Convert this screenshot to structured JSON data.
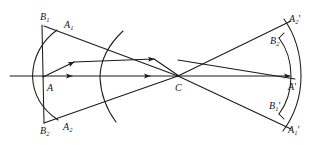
{
  "figure": {
    "stroke_color": "#1a1a1a",
    "background_color": "#ffffff",
    "width": 324,
    "height": 145
  },
  "labels": [
    {
      "id": "B1",
      "base": "B",
      "sub": "1",
      "prime": "",
      "x": 40,
      "y": 12,
      "name": "label-B1"
    },
    {
      "id": "A1",
      "base": "A",
      "sub": "1",
      "prime": "",
      "x": 64,
      "y": 20,
      "name": "label-A1"
    },
    {
      "id": "A",
      "base": "A",
      "sub": "",
      "prime": "",
      "x": 47,
      "y": 83,
      "name": "label-A"
    },
    {
      "id": "B2",
      "base": "B",
      "sub": "2",
      "prime": "",
      "x": 40,
      "y": 126,
      "name": "label-B2"
    },
    {
      "id": "A2",
      "base": "A",
      "sub": "2",
      "prime": "",
      "x": 63,
      "y": 122,
      "name": "label-A2"
    },
    {
      "id": "C",
      "base": "C",
      "sub": "",
      "prime": "",
      "x": 175,
      "y": 83,
      "name": "label-C"
    },
    {
      "id": "A2prime",
      "base": "A",
      "sub": "2",
      "prime": "'",
      "x": 289,
      "y": 14,
      "name": "label-A2-prime"
    },
    {
      "id": "B2prime",
      "base": "B",
      "sub": "2",
      "prime": "",
      "x": 270,
      "y": 36,
      "name": "label-B2-prime"
    },
    {
      "id": "Aprime",
      "base": "A",
      "sub": "",
      "prime": "'",
      "x": 288,
      "y": 82,
      "name": "label-A-prime"
    },
    {
      "id": "B1prime",
      "base": "B",
      "sub": "1",
      "prime": "'",
      "x": 269,
      "y": 101,
      "name": "label-B1-prime"
    },
    {
      "id": "A1prime",
      "base": "A",
      "sub": "1",
      "prime": "'",
      "x": 288,
      "y": 125,
      "name": "label-A1-prime"
    }
  ],
  "geometry": {
    "optical_axis": {
      "x1": 10,
      "y1": 76,
      "x2": 300,
      "y2": 76
    },
    "axis_arrows": [
      {
        "x": 70,
        "y": 76,
        "angle": 0
      },
      {
        "x": 148,
        "y": 76,
        "angle": 0
      }
    ],
    "left_object_line": {
      "x1": 42,
      "y1": 25,
      "x2": 44,
      "y2": 123
    },
    "left_wavefront_arc": "M 57,30 Q 31,76 58,120",
    "middle_wavefront_arc": "M 122,32 Q 100,78 116,121",
    "right_wavefront_arc": "M 286,20 Q 305,76 284,130",
    "right_image_segment": "M 281,40 Q 293,76 280,112",
    "rays": [
      {
        "id": "chief-upper",
        "x1": 44,
        "y1": 26,
        "x2": 178,
        "y2": 76,
        "arrow_at": null
      },
      {
        "id": "chief-lower",
        "x1": 44,
        "y1": 123,
        "x2": 178,
        "y2": 76,
        "arrow_at": null
      },
      {
        "id": "marginal-up",
        "x1": 43,
        "y1": 77,
        "x2": 178,
        "y2": 76,
        "arrow_at": {
          "x": 72,
          "y": 62
        }
      },
      {
        "id": "exit-upper",
        "x1": 178,
        "y1": 76,
        "x2": 290,
        "y2": 22,
        "arrow_at": null
      },
      {
        "id": "exit-lower",
        "x1": 178,
        "y1": 76,
        "x2": 290,
        "y2": 128,
        "arrow_at": null
      },
      {
        "id": "exit-axial",
        "x1": 178,
        "y1": 76,
        "x2": 296,
        "y2": 76,
        "arrow_at": {
          "x": 278,
          "y": 76
        }
      },
      {
        "id": "oblique-in",
        "x1": 43,
        "y1": 77,
        "x2": 178,
        "y2": 60,
        "arrow_at": {
          "x": 152,
          "y": 59
        }
      },
      {
        "id": "oblique-out",
        "x1": 178,
        "y1": 60,
        "x2": 296,
        "y2": 78,
        "arrow_at": null
      }
    ]
  }
}
